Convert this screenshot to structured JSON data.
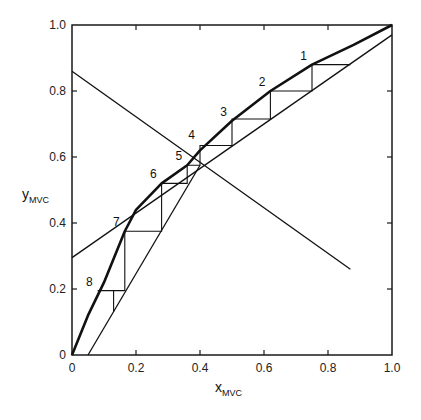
{
  "chart_data": {
    "type": "line",
    "title": "",
    "xlabel": "x",
    "xlabel_sub": "MVC",
    "ylabel": "y",
    "ylabel_sub": "MVC",
    "xlim": [
      0,
      1.0
    ],
    "ylim": [
      0,
      1.0
    ],
    "grid": false,
    "legend": "none",
    "x_ticks": [
      0,
      0.2,
      0.4,
      0.6,
      0.8,
      1.0
    ],
    "x_tick_labels": [
      "0",
      "0.2",
      "0.4",
      "0.6",
      "0.8",
      "1.0"
    ],
    "y_ticks": [
      0,
      0.2,
      0.4,
      0.6,
      0.8,
      1.0
    ],
    "y_tick_labels": [
      "0",
      "0.2",
      "0.4",
      "0.6",
      "0.8",
      "1.0"
    ],
    "series": [
      {
        "name": "equilibrium curve",
        "style": "thick",
        "x": [
          0,
          0.05,
          0.1,
          0.165,
          0.2,
          0.28,
          0.36,
          0.4,
          0.5,
          0.62,
          0.75,
          0.88,
          1.0
        ],
        "y": [
          0,
          0.12,
          0.22,
          0.375,
          0.44,
          0.52,
          0.575,
          0.62,
          0.71,
          0.8,
          0.88,
          0.94,
          1.0
        ]
      },
      {
        "name": "rectifying operating line",
        "style": "thin",
        "x": [
          0,
          1.0
        ],
        "y": [
          0.295,
          0.97
        ]
      },
      {
        "name": "stripping operating line",
        "style": "thin",
        "x": [
          0.05,
          0.4
        ],
        "y": [
          0,
          0.575
        ]
      },
      {
        "name": "q-line",
        "style": "thin",
        "x": [
          0,
          0.87
        ],
        "y": [
          0.86,
          0.26
        ]
      },
      {
        "name": "diagonal y=x",
        "style": "thin",
        "x": [
          0,
          1.0
        ],
        "y": [
          0,
          1.0
        ],
        "note": "implicit; rectifying line ends near (1,1)"
      }
    ],
    "stages": [
      {
        "label": "1",
        "x": 0.75,
        "y": 0.88
      },
      {
        "label": "2",
        "x": 0.62,
        "y": 0.8
      },
      {
        "label": "3",
        "x": 0.5,
        "y": 0.71
      },
      {
        "label": "4",
        "x": 0.4,
        "y": 0.64
      },
      {
        "label": "5",
        "x": 0.36,
        "y": 0.575
      },
      {
        "label": "6",
        "x": 0.28,
        "y": 0.52
      },
      {
        "label": "7",
        "x": 0.165,
        "y": 0.375
      },
      {
        "label": "8",
        "x": 0.08,
        "y": 0.195
      }
    ],
    "staircase": [
      [
        0.87,
        0.88
      ],
      [
        0.75,
        0.88
      ],
      [
        0.75,
        0.8
      ],
      [
        0.62,
        0.8
      ],
      [
        0.62,
        0.715
      ],
      [
        0.5,
        0.715
      ],
      [
        0.5,
        0.635
      ],
      [
        0.4,
        0.635
      ],
      [
        0.4,
        0.575
      ],
      [
        0.36,
        0.575
      ],
      [
        0.36,
        0.52
      ],
      [
        0.28,
        0.52
      ],
      [
        0.28,
        0.375
      ],
      [
        0.165,
        0.375
      ],
      [
        0.165,
        0.195
      ],
      [
        0.08,
        0.195
      ],
      [
        0.08,
        0.195
      ],
      [
        0.13,
        0.195
      ],
      [
        0.13,
        0.13
      ]
    ],
    "annotations": [
      "1",
      "2",
      "3",
      "4",
      "5",
      "6",
      "7",
      "8"
    ]
  }
}
